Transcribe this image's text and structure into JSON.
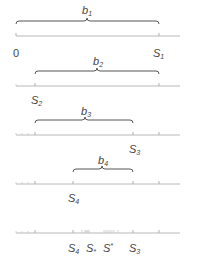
{
  "diagram": {
    "rows": [
      {
        "brace_label": "b",
        "brace_sub": "1",
        "left_label": "0",
        "right_label": "S",
        "right_sub": "1"
      },
      {
        "brace_label": "b",
        "brace_sub": "2",
        "point_label": "S",
        "point_sub": "2"
      },
      {
        "brace_label": "b",
        "brace_sub": "3",
        "point_label": "S",
        "point_sub": "3"
      },
      {
        "brace_label": "b",
        "brace_sub": "4",
        "point_label": "S",
        "point_sub": "4"
      },
      {
        "labels": [
          {
            "main": "S",
            "sub": "4"
          },
          {
            "main": "S",
            "sub": "*"
          },
          {
            "main": "S",
            "sup": "*"
          },
          {
            "main": "S",
            "sub": "3"
          }
        ]
      }
    ],
    "colors": {
      "axis": "#b8b8b8",
      "brace": "#555555",
      "text": "#444444"
    }
  }
}
